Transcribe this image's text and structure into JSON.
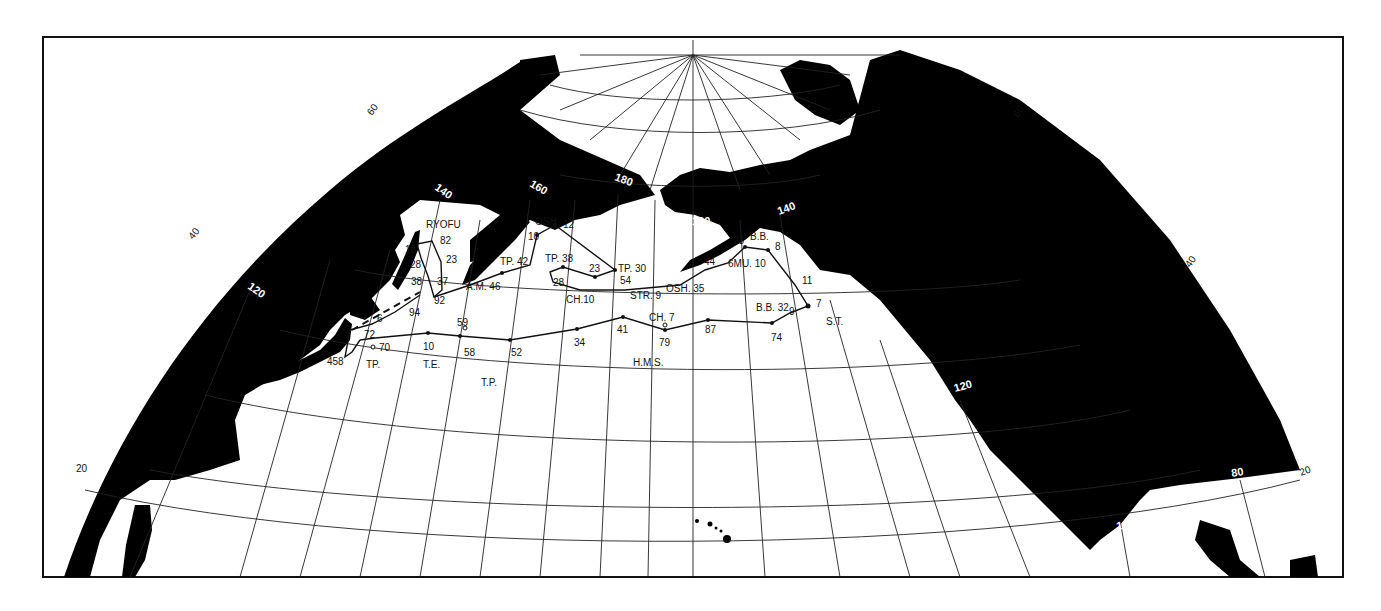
{
  "map": {
    "title": "North Pacific ship tracks",
    "frame": {
      "x": 43,
      "y": 37,
      "width": 1300,
      "height": 540
    },
    "colors": {
      "land": "#000000",
      "ocean": "#ffffff",
      "grid": "#222222",
      "track": "#111111"
    },
    "latitude_labels": {
      "left": [
        {
          "text": "60",
          "x": 372,
          "y": 116,
          "r": -55
        },
        {
          "text": "40",
          "x": 193,
          "y": 240,
          "r": -52
        },
        {
          "text": "20",
          "x": 76,
          "y": 472,
          "r": 0
        }
      ],
      "right": [
        {
          "text": "60",
          "x": 1018,
          "y": 118,
          "r": -55
        },
        {
          "text": "40",
          "x": 1190,
          "y": 268,
          "r": -55
        },
        {
          "text": "20",
          "x": 1301,
          "y": 476,
          "r": -20
        }
      ]
    },
    "longitude_labels": [
      {
        "text": "120",
        "x": 247,
        "y": 288,
        "r": 35
      },
      {
        "text": "140",
        "x": 434,
        "y": 189,
        "r": 35
      },
      {
        "text": "160",
        "x": 529,
        "y": 186,
        "r": 30
      },
      {
        "text": "180",
        "x": 614,
        "y": 180,
        "r": 20
      },
      {
        "text": "160",
        "x": 692,
        "y": 225,
        "r": 0
      },
      {
        "text": "140",
        "x": 779,
        "y": 215,
        "r": -20
      },
      {
        "text": "120",
        "x": 955,
        "y": 392,
        "r": -15
      },
      {
        "text": "100",
        "x": 1117,
        "y": 530,
        "r": -10
      },
      {
        "text": "80",
        "x": 1232,
        "y": 477,
        "r": -10
      }
    ],
    "ship_labels": [
      {
        "text": "RYOFU",
        "x": 426,
        "y": 228
      },
      {
        "text": "OSH.",
        "x": 535,
        "y": 225
      },
      {
        "text": "TP. 42",
        "x": 500,
        "y": 265
      },
      {
        "text": "TP. 38",
        "x": 545,
        "y": 262
      },
      {
        "text": "TP. 30",
        "x": 618,
        "y": 272
      },
      {
        "text": "A.M. 46",
        "x": 466,
        "y": 290
      },
      {
        "text": "CH.10",
        "x": 566,
        "y": 303
      },
      {
        "text": "STR. 9",
        "x": 630,
        "y": 299
      },
      {
        "text": "OSH. 35",
        "x": 666,
        "y": 292
      },
      {
        "text": "6MU. 10",
        "x": 728,
        "y": 267
      },
      {
        "text": "B.B.",
        "x": 750,
        "y": 240
      },
      {
        "text": "B.B. 32",
        "x": 756,
        "y": 311
      },
      {
        "text": "S.T.",
        "x": 826,
        "y": 325
      },
      {
        "text": "CH. 7",
        "x": 649,
        "y": 321
      },
      {
        "text": "H.M.S.",
        "x": 633,
        "y": 366
      },
      {
        "text": "TP.",
        "x": 366,
        "y": 368
      },
      {
        "text": "T.E.",
        "x": 423,
        "y": 368
      },
      {
        "text": "T.P.",
        "x": 481,
        "y": 386
      }
    ],
    "point_labels": [
      {
        "text": "12",
        "x": 563,
        "y": 228
      },
      {
        "text": "10",
        "x": 528,
        "y": 240
      },
      {
        "text": "82",
        "x": 440,
        "y": 244
      },
      {
        "text": "18",
        "x": 405,
        "y": 253
      },
      {
        "text": "23",
        "x": 446,
        "y": 263
      },
      {
        "text": "28",
        "x": 410,
        "y": 268
      },
      {
        "text": "38",
        "x": 411,
        "y": 285
      },
      {
        "text": "37",
        "x": 437,
        "y": 285
      },
      {
        "text": "92",
        "x": 434,
        "y": 304
      },
      {
        "text": "94",
        "x": 409,
        "y": 316
      },
      {
        "text": "6",
        "x": 377,
        "y": 322
      },
      {
        "text": "23",
        "x": 589,
        "y": 272
      },
      {
        "text": "28",
        "x": 553,
        "y": 286
      },
      {
        "text": "54",
        "x": 620,
        "y": 284
      },
      {
        "text": "44",
        "x": 704,
        "y": 265
      },
      {
        "text": "23",
        "x": 733,
        "y": 244
      },
      {
        "text": "8",
        "x": 775,
        "y": 250
      },
      {
        "text": "11",
        "x": 802,
        "y": 284
      },
      {
        "text": "7",
        "x": 816,
        "y": 307
      },
      {
        "text": "9",
        "x": 789,
        "y": 315
      },
      {
        "text": "72",
        "x": 364,
        "y": 338
      },
      {
        "text": "70",
        "x": 379,
        "y": 351
      },
      {
        "text": "458",
        "x": 327,
        "y": 365
      },
      {
        "text": "10",
        "x": 423,
        "y": 350
      },
      {
        "text": "59",
        "x": 457,
        "y": 326
      },
      {
        "text": "58",
        "x": 464,
        "y": 356
      },
      {
        "text": "52",
        "x": 511,
        "y": 356
      },
      {
        "text": "34",
        "x": 574,
        "y": 346
      },
      {
        "text": "41",
        "x": 617,
        "y": 333
      },
      {
        "text": "79",
        "x": 659,
        "y": 346
      },
      {
        "text": "87",
        "x": 705,
        "y": 333
      },
      {
        "text": "74",
        "x": 771,
        "y": 341
      }
    ]
  }
}
